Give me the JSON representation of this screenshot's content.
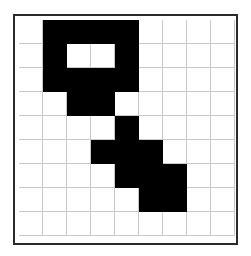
{
  "grid": {
    "rows": 9,
    "cols": 9,
    "fill_color": "#000000",
    "empty_color": "#ffffff",
    "line_color": "#c8c8c8",
    "cells": [
      [
        0,
        1,
        1,
        1,
        1,
        0,
        0,
        0,
        0
      ],
      [
        0,
        1,
        0,
        0,
        1,
        0,
        0,
        0,
        0
      ],
      [
        0,
        1,
        1,
        1,
        1,
        0,
        0,
        0,
        0
      ],
      [
        0,
        0,
        1,
        1,
        0,
        0,
        0,
        0,
        0
      ],
      [
        0,
        0,
        0,
        0,
        1,
        0,
        0,
        0,
        0
      ],
      [
        0,
        0,
        0,
        1,
        1,
        1,
        0,
        0,
        0
      ],
      [
        0,
        0,
        0,
        0,
        1,
        1,
        1,
        0,
        0
      ],
      [
        0,
        0,
        0,
        0,
        0,
        1,
        1,
        0,
        0
      ],
      [
        0,
        0,
        0,
        0,
        0,
        0,
        0,
        0,
        0
      ]
    ]
  }
}
